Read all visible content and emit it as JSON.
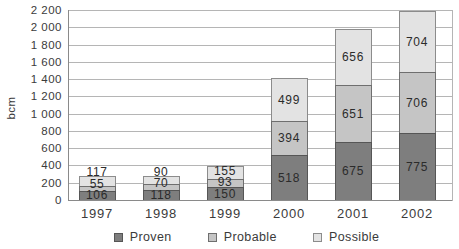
{
  "chart_data": {
    "type": "bar",
    "stacked": true,
    "title": "",
    "ylabel": "bcm",
    "categories": [
      "1997",
      "1998",
      "1999",
      "2000",
      "2001",
      "2002"
    ],
    "series": [
      {
        "name": "Proven",
        "values": [
          106,
          118,
          150,
          518,
          675,
          775
        ],
        "color": "#7e7e7e",
        "border_color": "#565656"
      },
      {
        "name": "Probable",
        "values": [
          55,
          70,
          93,
          394,
          651,
          706
        ],
        "color": "#c5c5c5",
        "border_color": "#6f6f6f"
      },
      {
        "name": "Possible",
        "values": [
          117,
          90,
          155,
          499,
          656,
          704
        ],
        "color": "#e3e3e3",
        "border_color": "#8c8c8c"
      }
    ],
    "ylim": [
      0,
      2200
    ],
    "ytick_values": [
      0,
      200,
      400,
      600,
      800,
      1000,
      1200,
      1400,
      1600,
      1800,
      2000,
      2200
    ],
    "ytick_labels": [
      "0",
      "200",
      "400",
      "600",
      "800",
      "1 000",
      "1 200",
      "1 400",
      "1 600",
      "1 800",
      "2 000",
      "2 200"
    ],
    "grid": true,
    "legend_position": "bottom",
    "colors": {
      "gridline": "#b5b5b5",
      "axis": "#8a8a8a",
      "text": "#3b3b3b",
      "value_label": "#2b2b2b",
      "background": "#ffffff"
    }
  }
}
